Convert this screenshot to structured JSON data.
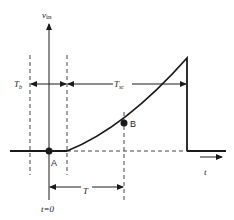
{
  "figure": {
    "type": "timing-diagram",
    "colors": {
      "ink": "#1a1a1a",
      "dash": "#444444",
      "background": "#ffffff"
    },
    "labels": {
      "y_axis": "v",
      "y_axis_sub": "in",
      "x_axis": "t",
      "origin": "t=0",
      "point_a": "A",
      "point_b": "B",
      "interval_b": "T",
      "interval_b_sub": "b",
      "interval_sc": "T",
      "interval_sc_sub": "sc",
      "interval_t": "T"
    },
    "points": [
      {
        "name": "A",
        "x": 49,
        "y": 151
      },
      {
        "name": "B",
        "x": 124,
        "y": 123
      }
    ]
  }
}
